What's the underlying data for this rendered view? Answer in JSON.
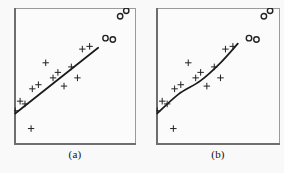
{
  "figure": {
    "background_color": "#f9f9f9",
    "frame_color": "#8b8b8b",
    "marker_color": "#222222",
    "line_color": "#1a1a1a"
  },
  "panels": [
    {
      "id": "a",
      "label": "(a)"
    },
    {
      "id": "b",
      "label": "(b)"
    }
  ],
  "chart_data": [
    {
      "type": "scatter",
      "title": "(a)",
      "xlabel": "",
      "ylabel": "",
      "xlim": [
        0,
        100
      ],
      "ylim": [
        0,
        100
      ],
      "grid": false,
      "legend": "none",
      "annotations": [
        "linear least-squares fit through the plus-marked points",
        "four open-circle outliers in the upper right are excluded from the fit"
      ],
      "series": [
        {
          "name": "inliers",
          "marker": "plus",
          "points": [
            [
              1,
              25
            ],
            [
              5,
              32
            ],
            [
              9,
              30
            ],
            [
              15,
              41
            ],
            [
              20,
              44
            ],
            [
              26,
              60
            ],
            [
              32,
              49
            ],
            [
              36,
              53
            ],
            [
              41,
              43
            ],
            [
              47,
              57
            ],
            [
              52,
              49
            ],
            [
              56,
              70
            ],
            [
              62,
              72
            ],
            [
              14,
              12
            ]
          ]
        },
        {
          "name": "outliers",
          "marker": "open-circle",
          "points": [
            [
              75,
              78
            ],
            [
              81,
              77
            ],
            [
              87,
              94
            ],
            [
              92,
              98
            ]
          ]
        },
        {
          "name": "fit-line",
          "marker": "line",
          "points": [
            [
              1,
              23
            ],
            [
              69,
              71
            ]
          ]
        }
      ]
    },
    {
      "type": "scatter",
      "title": "(b)",
      "xlabel": "",
      "ylabel": "",
      "xlim": [
        0,
        100
      ],
      "ylim": [
        0,
        100
      ],
      "grid": false,
      "legend": "none",
      "annotations": [
        "nonlinear (curved) fit through the plus-marked points",
        "four open-circle outliers in the upper right are excluded from the fit"
      ],
      "series": [
        {
          "name": "inliers",
          "marker": "plus",
          "points": [
            [
              1,
              25
            ],
            [
              5,
              32
            ],
            [
              9,
              30
            ],
            [
              15,
              41
            ],
            [
              20,
              44
            ],
            [
              26,
              60
            ],
            [
              32,
              49
            ],
            [
              36,
              53
            ],
            [
              41,
              43
            ],
            [
              47,
              57
            ],
            [
              52,
              49
            ],
            [
              56,
              70
            ],
            [
              62,
              72
            ],
            [
              14,
              12
            ]
          ]
        },
        {
          "name": "outliers",
          "marker": "open-circle",
          "points": [
            [
              75,
              78
            ],
            [
              81,
              77
            ],
            [
              87,
              94
            ],
            [
              92,
              98
            ]
          ]
        },
        {
          "name": "fit-curve",
          "marker": "curve",
          "points": [
            [
              1,
              23
            ],
            [
              18,
              37
            ],
            [
              36,
              47
            ],
            [
              52,
              60
            ],
            [
              66,
              74
            ]
          ]
        }
      ]
    }
  ]
}
